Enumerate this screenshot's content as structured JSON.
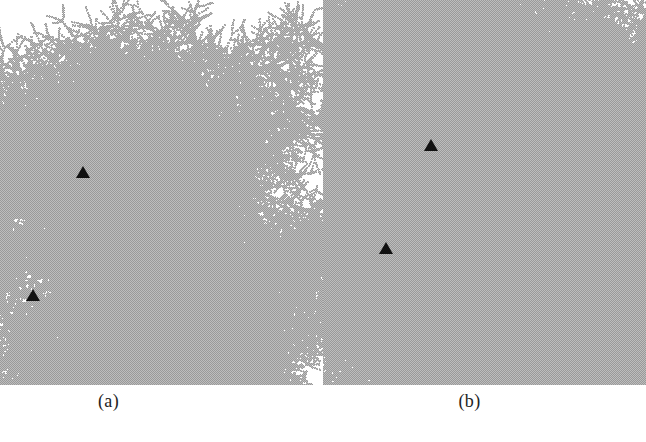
{
  "figure": {
    "background_color": "#ffffff",
    "width": 646,
    "height": 442,
    "cluster_color": "#a8a8a8",
    "marker_color": "#111111"
  },
  "panels": [
    {
      "id": "a",
      "label": "(a)",
      "cluster_name": "dla-cluster-a",
      "markers": [
        {
          "name": "triangle-marker-a-upper",
          "x": 83,
          "y": 172
        },
        {
          "name": "triangle-marker-a-lower",
          "x": 33,
          "y": 295
        }
      ]
    },
    {
      "id": "b",
      "label": "(b)",
      "cluster_name": "dla-cluster-b",
      "markers": [
        {
          "name": "triangle-marker-b-upper",
          "x": 108,
          "y": 145
        },
        {
          "name": "triangle-marker-b-lower",
          "x": 63,
          "y": 248
        }
      ]
    }
  ],
  "chart_data": {
    "type": "scatter",
    "title": "",
    "subtitle": "",
    "xlabel": "",
    "ylabel": "",
    "legend": [],
    "annotations": [
      "(a)",
      "(b)"
    ],
    "grid": false,
    "series": [
      {
        "name": "dla-cluster-a",
        "description": "Diffusion-limited aggregation cluster, panel (a)",
        "color": "#a8a8a8",
        "center": [
          131,
          245
        ],
        "radius": 118,
        "branch_count": 11,
        "seed": 11731,
        "particle_scale": 0.78,
        "bounds": {
          "x0": 18,
          "y0": 118,
          "x1": 248,
          "y1": 370
        }
      },
      {
        "name": "dla-cluster-b",
        "description": "Diffusion-limited aggregation cluster, panel (b)",
        "color": "#a8a8a8",
        "center": [
          148,
          215
        ],
        "radius": 152,
        "branch_count": 13,
        "seed": 20717,
        "particle_scale": 0.78,
        "bounds": {
          "x0": 5,
          "y0": 22,
          "x1": 302,
          "y1": 372
        }
      }
    ],
    "markers": {
      "shape": "triangle-up",
      "color": "#111111",
      "points": [
        {
          "panel": "a",
          "x": 83,
          "y": 172
        },
        {
          "panel": "a",
          "x": 33,
          "y": 295
        },
        {
          "panel": "b",
          "x": 431,
          "y": 145
        },
        {
          "panel": "b",
          "x": 386,
          "y": 248
        }
      ]
    }
  }
}
